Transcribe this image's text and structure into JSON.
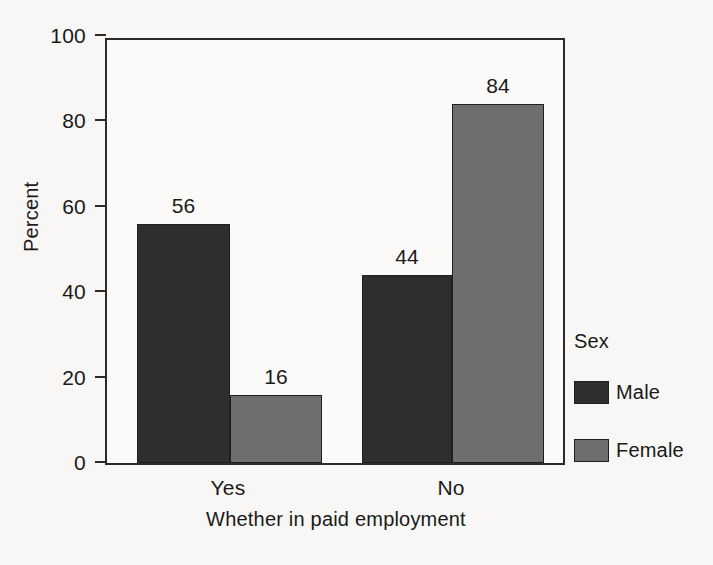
{
  "chart_data": {
    "type": "bar",
    "title": "",
    "xlabel": "Whether in paid employment",
    "ylabel": "Percent",
    "categories": [
      "Yes",
      "No"
    ],
    "series": [
      {
        "name": "Male",
        "values": [
          56,
          44
        ],
        "color": "#2e2e2e"
      },
      {
        "name": "Female",
        "values": [
          16,
          84
        ],
        "color": "#6e6e6e"
      }
    ],
    "ylim": [
      0,
      100
    ],
    "yticks": [
      0,
      20,
      40,
      60,
      80,
      100
    ],
    "ytick_labels": [
      "0",
      "20",
      "40",
      "60",
      "80",
      "100"
    ],
    "grid": false,
    "data_labels": [
      "56",
      "16",
      "44",
      "84"
    ],
    "legend": {
      "title": "Sex",
      "position": "right-outside",
      "entries": [
        {
          "label": "Male",
          "color": "#2e2e2e"
        },
        {
          "label": "Female",
          "color": "#6e6e6e"
        }
      ]
    },
    "colors": {
      "male": "#2e2e2e",
      "female": "#6e6e6e",
      "axis": "#2b2b2b",
      "background": "#f8f7f5",
      "plot_background": "#fbfaf8",
      "text": "#1a1a1a"
    }
  }
}
